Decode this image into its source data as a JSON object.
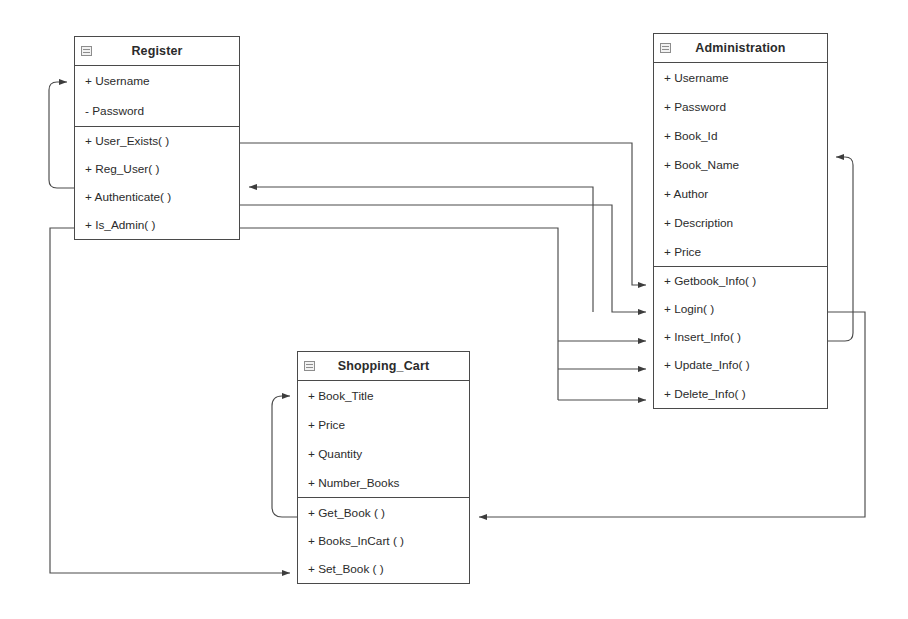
{
  "diagram": {
    "type": "UML Class Diagram",
    "background_color": "#ffffff",
    "line_color": "#4a4a4a",
    "text_color": "#2b2b2b"
  },
  "classes": [
    {
      "id": "register",
      "name": "Register",
      "attributes": [
        "+ Username",
        "- Password"
      ],
      "methods": [
        "+ User_Exists( )",
        "+ Reg_User( )",
        "+ Authenticate( )",
        "+ Is_Admin( )"
      ]
    },
    {
      "id": "administration",
      "name": "Administration",
      "attributes": [
        "+ Username",
        "+ Password",
        "+ Book_Id",
        "+ Book_Name",
        "+ Author",
        "+ Description",
        "+ Price"
      ],
      "methods": [
        "+ Getbook_Info( )",
        "+ Login( )",
        "+ Insert_Info( )",
        "+ Update_Info( )",
        "+ Delete_Info( )"
      ]
    },
    {
      "id": "shopping_cart",
      "name": "Shopping_Cart",
      "attributes": [
        "+ Book_Title",
        "+ Price",
        "+ Quantity",
        "+ Number_Books"
      ],
      "methods": [
        "+ Get_Book ( )",
        "+ Books_InCart ( )",
        "+ Set_Book ( )"
      ]
    }
  ],
  "connectors": [
    {
      "from": "Register.Authenticate( )",
      "to": "Register.Username",
      "style": "self-loop-left"
    },
    {
      "from": "Register.User_Exists( )",
      "to": "Administration.Getbook_Info( )",
      "style": "orthogonal"
    },
    {
      "from": "Register.Reg_User( )",
      "to": "Administration.Login( )",
      "style": "orthogonal"
    },
    {
      "from": "Administration.Login( )",
      "to": "Register.Authenticate( )",
      "style": "orthogonal"
    },
    {
      "from": "Register.Is_Admin( )",
      "to": "Administration.Insert_Info( )",
      "style": "orthogonal"
    },
    {
      "from": "Register.Is_Admin( )",
      "to": "Administration.Update_Info( )",
      "style": "orthogonal"
    },
    {
      "from": "Register.Is_Admin( )",
      "to": "Administration.Delete_Info( )",
      "style": "orthogonal"
    },
    {
      "from": "Administration.Insert_Info( )",
      "to": "Administration.Book_Name",
      "style": "self-loop-right"
    },
    {
      "from": "Administration.Login( )",
      "to": "Shopping_Cart.Get_Book ( )",
      "style": "orthogonal"
    },
    {
      "from": "Shopping_Cart.Get_Book ( )",
      "to": "Shopping_Cart.Book_Title",
      "style": "self-loop-left"
    },
    {
      "from": "Register.Is_Admin( )",
      "to": "Shopping_Cart.Set_Book ( )",
      "style": "orthogonal"
    }
  ]
}
